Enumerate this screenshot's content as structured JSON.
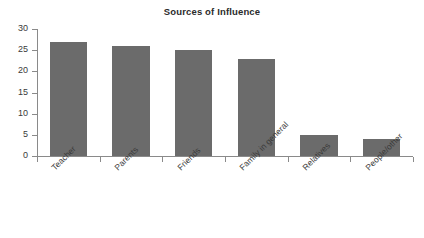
{
  "chart_data": {
    "type": "bar",
    "title": "Sources of Influence",
    "xlabel": "",
    "ylabel": "",
    "categories": [
      "Teacher",
      "Parents",
      "Friends",
      "Family in general",
      "Relatives",
      "People/other"
    ],
    "values": [
      27,
      26,
      25,
      23,
      5,
      4
    ],
    "ylim": [
      0,
      30
    ],
    "yticks": [
      0,
      5,
      10,
      15,
      20,
      25,
      30
    ],
    "ytick_labels": [
      "0",
      "5",
      "10",
      "15",
      "20",
      "25",
      "30"
    ],
    "grid": false,
    "legend": false,
    "bar_color": "#6b6b6b",
    "axis_color": "#8a8a8a",
    "text_color": "#3a3a3a",
    "xtick_rotation": -45
  }
}
